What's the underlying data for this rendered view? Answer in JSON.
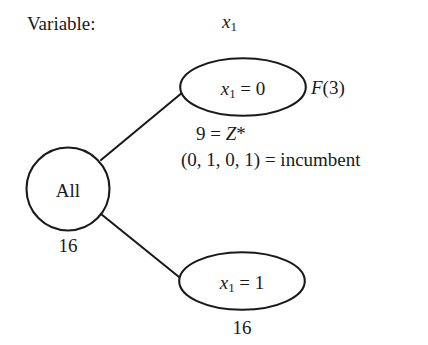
{
  "diagram": {
    "type": "branch-and-bound-tree",
    "variable_label": "Variable:",
    "column_header": "x1",
    "column_header_base": "x",
    "column_header_sub": "1",
    "root": {
      "label": "All",
      "count": "16"
    },
    "branches": [
      {
        "name": "x1-equals-0",
        "var_base": "x",
        "var_sub": "1",
        "relation": " = 0",
        "fathom_note": "F(3)",
        "fathom_note_base": "F",
        "fathom_note_arg": "(3)"
      },
      {
        "name": "x1-equals-1",
        "var_base": "x",
        "var_sub": "1",
        "relation": " = 1",
        "count": "16"
      }
    ],
    "annotations": {
      "objective_line_prefix": "9 = ",
      "objective_line_var": "Z",
      "objective_line_suffix": "*",
      "incumbent_line": "(0, 1, 0, 1) = incumbent"
    },
    "colors": {
      "background": "#ffffff",
      "stroke": "#1a1a1a",
      "text": "#1a1a1a"
    }
  }
}
